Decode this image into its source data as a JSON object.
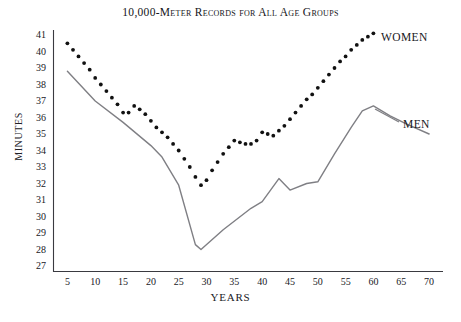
{
  "chart_data": {
    "type": "line",
    "title": "10,000-Meter Records for All Age Groups",
    "xlabel": "YEARS",
    "ylabel": "MINUTES",
    "xlim": [
      2.5,
      72.5
    ],
    "ylim": [
      26.5,
      41.5
    ],
    "grid": false,
    "legend_position": "inline-right",
    "x_ticks": [
      5,
      10,
      15,
      20,
      25,
      30,
      35,
      40,
      45,
      50,
      55,
      60,
      65,
      70
    ],
    "y_ticks": [
      27,
      28,
      29,
      30,
      31,
      32,
      33,
      34,
      35,
      36,
      37,
      38,
      39,
      40,
      41
    ],
    "series": [
      {
        "name": "WOMEN",
        "style": "dotted",
        "color": "#111111",
        "x": [
          5,
          6,
          7,
          8,
          9,
          10,
          11,
          12,
          13,
          14,
          15,
          16,
          17,
          18,
          19,
          20,
          21,
          22,
          23,
          24,
          25,
          26,
          27,
          28,
          29,
          30,
          31,
          32,
          33,
          34,
          35,
          36,
          37,
          38,
          39,
          40,
          41,
          42,
          43,
          44,
          45,
          46,
          47,
          48,
          49,
          50,
          51,
          52,
          53,
          54,
          55,
          56,
          57,
          58,
          59,
          60
        ],
        "values": [
          40.5,
          40.1,
          39.7,
          39.3,
          38.9,
          38.4,
          38.0,
          37.6,
          37.2,
          36.8,
          36.3,
          36.3,
          36.7,
          36.5,
          36.2,
          35.8,
          35.4,
          35.1,
          34.8,
          34.4,
          34.0,
          33.5,
          33.0,
          32.4,
          31.9,
          32.2,
          32.8,
          33.3,
          33.8,
          34.2,
          34.6,
          34.5,
          34.4,
          34.4,
          34.6,
          35.1,
          35.0,
          34.9,
          35.2,
          35.5,
          35.9,
          36.3,
          36.7,
          37.1,
          37.4,
          37.8,
          38.2,
          38.6,
          39.0,
          39.4,
          39.7,
          40.1,
          40.4,
          40.7,
          40.9,
          41.1
        ]
      },
      {
        "name": "MEN",
        "style": "solid",
        "color": "#7f7f84",
        "x": [
          5,
          10,
          15,
          20,
          22,
          25,
          28,
          29,
          33,
          38,
          40,
          43,
          45,
          48,
          50,
          53,
          56,
          58,
          60,
          63,
          66,
          70
        ],
        "values": [
          38.8,
          37.0,
          35.7,
          34.3,
          33.6,
          31.9,
          28.3,
          28.0,
          29.2,
          30.5,
          30.9,
          32.3,
          31.6,
          32.0,
          32.1,
          33.8,
          35.4,
          36.4,
          36.7,
          36.1,
          35.6,
          35.0
        ]
      }
    ]
  },
  "labels": {
    "women": "WOMEN",
    "men": "MEN"
  }
}
